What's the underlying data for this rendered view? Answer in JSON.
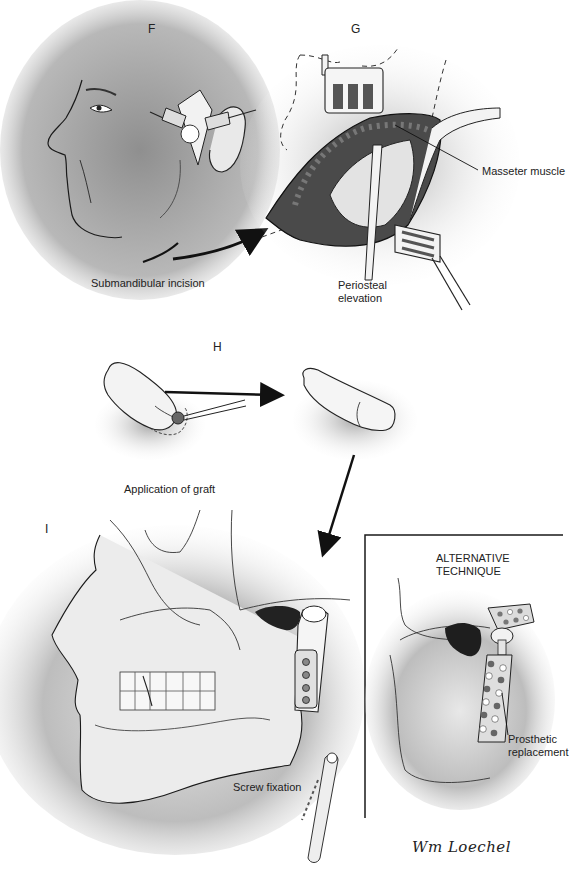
{
  "figure": {
    "panels": [
      {
        "id": "F",
        "letter": "F",
        "caption": "Submandibular incision"
      },
      {
        "id": "G",
        "letter": "G",
        "callouts": [
          "Masseter muscle"
        ],
        "caption": "Periosteal elevation"
      },
      {
        "id": "H",
        "letter": "H",
        "caption": "Application of graft"
      },
      {
        "id": "I",
        "letter": "I",
        "callouts": [
          "Screw fixation"
        ]
      }
    ],
    "inset": {
      "title_line1": "ALTERNATIVE",
      "title_line2": "TECHNIQUE",
      "callout_line1": "Prosthetic",
      "callout_line2": "replacement"
    },
    "signature": "Wm Loechel",
    "colors": {
      "ink": "#1a1a1a",
      "shade": "#9a9a9a",
      "light_shade": "#d4d4d4",
      "paper": "#ffffff"
    }
  }
}
